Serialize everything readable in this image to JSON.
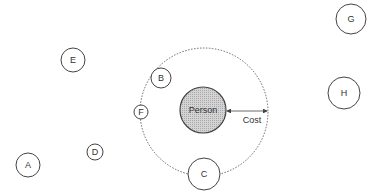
{
  "diagram": {
    "center": {
      "label": "Person",
      "fill": "#c8c8c8"
    },
    "cost_label": "Cost",
    "nodes": [
      {
        "id": "A",
        "label": "A"
      },
      {
        "id": "B",
        "label": "B"
      },
      {
        "id": "C",
        "label": "C"
      },
      {
        "id": "D",
        "label": "D"
      },
      {
        "id": "E",
        "label": "E"
      },
      {
        "id": "F",
        "label": "F"
      },
      {
        "id": "G",
        "label": "G"
      },
      {
        "id": "H",
        "label": "H"
      }
    ],
    "colors": {
      "stroke": "#444444",
      "dashed": "#666666"
    }
  }
}
